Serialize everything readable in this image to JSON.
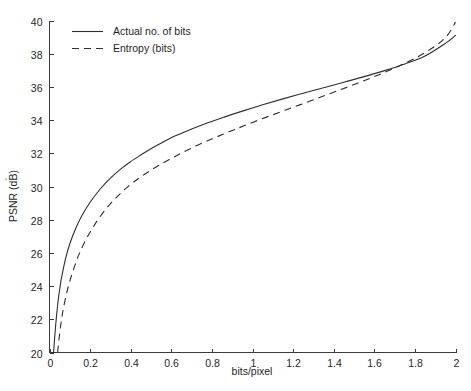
{
  "chart_data": {
    "type": "line",
    "title": "",
    "xlabel": "bits/pixel",
    "ylabel": "PSNR (dB)",
    "xlim": [
      0,
      2
    ],
    "ylim": [
      20,
      40
    ],
    "grid": false,
    "legend_position": "top-left",
    "xticks": [
      0,
      0.2,
      0.4,
      0.6,
      0.8,
      1,
      1.2,
      1.4,
      1.6,
      1.8,
      2
    ],
    "xticklabels": [
      "0",
      "0.2",
      "0.4",
      "0.6",
      "0.8",
      "1",
      "1.2",
      "1.4",
      "1.6",
      "1.8",
      "2"
    ],
    "yticks": [
      20,
      22,
      24,
      26,
      28,
      30,
      32,
      34,
      36,
      38,
      40
    ],
    "yticklabels": [
      "20",
      "22",
      "24",
      "26",
      "28",
      "30",
      "32",
      "34",
      "36",
      "38",
      "40"
    ],
    "series": [
      {
        "name": "Actual no. of bits",
        "style": "solid",
        "color": "#2e2e2e",
        "x": [
          0.02,
          0.03,
          0.04,
          0.05,
          0.06,
          0.08,
          0.1,
          0.13,
          0.16,
          0.2,
          0.25,
          0.3,
          0.35,
          0.4,
          0.45,
          0.5,
          0.56,
          0.62,
          0.7,
          0.78,
          0.86,
          0.95,
          1.05,
          1.15,
          1.25,
          1.35,
          1.45,
          1.55,
          1.65,
          1.75,
          1.85,
          1.95,
          2.0
        ],
        "y": [
          20.0,
          21.6,
          22.85,
          23.8,
          24.55,
          25.7,
          26.55,
          27.5,
          28.25,
          29.05,
          29.85,
          30.5,
          31.05,
          31.5,
          31.9,
          32.28,
          32.68,
          33.05,
          33.46,
          33.84,
          34.18,
          34.54,
          34.92,
          35.28,
          35.62,
          35.95,
          36.28,
          36.62,
          36.98,
          37.38,
          37.86,
          38.62,
          39.1
        ]
      },
      {
        "name": "Entropy (bits)",
        "style": "dashed",
        "color": "#2e2e2e",
        "x": [
          0.04,
          0.05,
          0.06,
          0.07,
          0.085,
          0.1,
          0.125,
          0.15,
          0.185,
          0.225,
          0.275,
          0.33,
          0.385,
          0.44,
          0.495,
          0.55,
          0.61,
          0.67,
          0.75,
          0.83,
          0.91,
          1.0,
          1.1,
          1.2,
          1.3,
          1.4,
          1.5,
          1.6,
          1.7,
          1.8,
          1.9,
          1.96,
          2.0
        ],
        "y": [
          20.0,
          21.15,
          22.05,
          22.75,
          23.6,
          24.3,
          25.25,
          26.05,
          26.92,
          27.75,
          28.6,
          29.35,
          29.98,
          30.5,
          30.95,
          31.35,
          31.76,
          32.14,
          32.6,
          33.02,
          33.42,
          33.86,
          34.32,
          34.77,
          35.22,
          35.68,
          36.14,
          36.62,
          37.14,
          37.72,
          38.46,
          39.1,
          39.9
        ]
      }
    ]
  },
  "legend": {
    "items": [
      {
        "label": "Actual no. of bits",
        "style": "solid"
      },
      {
        "label": "Entropy (bits)",
        "style": "dashed"
      }
    ]
  },
  "artifact": {
    "stray_mark": "‘"
  }
}
